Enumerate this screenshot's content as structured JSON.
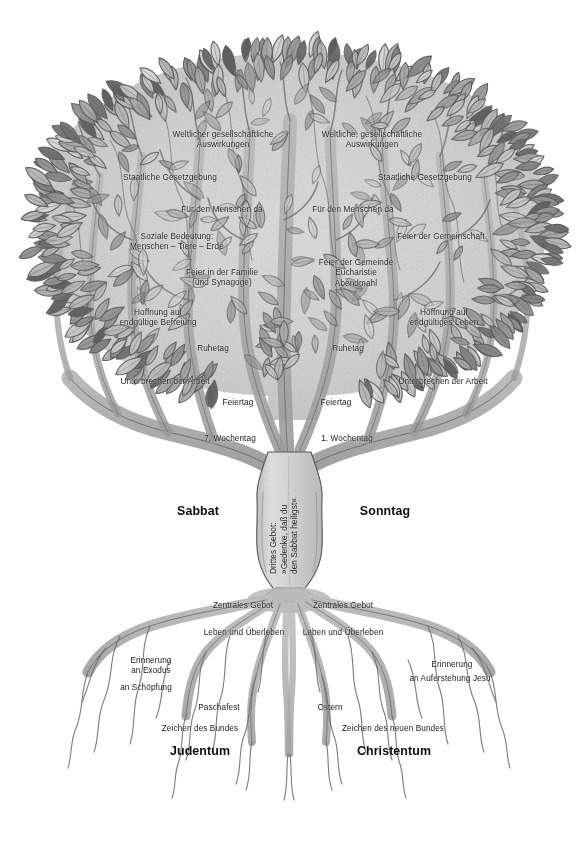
{
  "figure": {
    "type": "tree-diagram",
    "title_visible": false,
    "background_color": "#ffffff",
    "ink_color": "#4a4a4a",
    "palette": {
      "leaf_light": "#c8c8c8",
      "leaf_mid": "#9a9a9a",
      "leaf_dark": "#6b6b6b",
      "canopy_wash": "#d4d4d4",
      "branch": "#a8a8a8",
      "branch_dark": "#7d7d7d",
      "trunk": "#cfcfcf",
      "root": "#b4b4b4",
      "text": "#1a1a1a"
    }
  },
  "trunk": {
    "lines": [
      "Drittes Gebot:",
      "»Gedenke, daß du",
      "den Sabbat heiligst«"
    ]
  },
  "sides": {
    "left": {
      "name": "Sabbat",
      "base": "Judentum"
    },
    "right": {
      "name": "Sonntag",
      "base": "Christentum"
    }
  },
  "canopy_labels": {
    "left": [
      {
        "id": "l-weltliche",
        "text": "Weltlicher gesellschaftliche\nAuswirkungen",
        "x": 223,
        "y": 130,
        "align": "c"
      },
      {
        "id": "l-staatliche",
        "text": "Staatliche Gesetzgebung",
        "x": 170,
        "y": 173,
        "align": "c"
      },
      {
        "id": "l-fuerdenmenschen",
        "text": "Für den Menschen da",
        "x": 222,
        "y": 205,
        "align": "c"
      },
      {
        "id": "l-soziale",
        "text": "Soziale Bedeutung:\nMenschen – Tiere – Erde",
        "x": 177,
        "y": 232,
        "align": "c"
      },
      {
        "id": "l-feierfamilie",
        "text": "Feier in der Familie\n(und Synagoge)",
        "x": 222,
        "y": 268,
        "align": "c"
      },
      {
        "id": "l-hoffnung",
        "text": "Hoffnung auf\nendgültige Befreiung",
        "x": 158,
        "y": 308,
        "align": "c"
      },
      {
        "id": "l-ruhetag",
        "text": "Ruhetag",
        "x": 213,
        "y": 344,
        "align": "c"
      },
      {
        "id": "l-unterbrechen",
        "text": "Unterbrechen der Arbeit",
        "x": 165,
        "y": 377,
        "align": "c"
      },
      {
        "id": "l-feiertag",
        "text": "Feiertag",
        "x": 238,
        "y": 398,
        "align": "c"
      },
      {
        "id": "l-wochentag",
        "text": "7. Wochentag",
        "x": 230,
        "y": 434,
        "align": "c"
      }
    ],
    "right": [
      {
        "id": "r-weltliche",
        "text": "Weltliche, gesellschaftliche\nAuswirkungen",
        "x": 372,
        "y": 130,
        "align": "c"
      },
      {
        "id": "r-staatliche",
        "text": "Staatliche Gesetzgebung",
        "x": 425,
        "y": 173,
        "align": "c"
      },
      {
        "id": "r-fuerdenmenschen",
        "text": "Für den Menschen da",
        "x": 353,
        "y": 205,
        "align": "c"
      },
      {
        "id": "r-feiergemeinschaft",
        "text": "Feier der Gemeinschaft",
        "x": 441,
        "y": 232,
        "align": "c"
      },
      {
        "id": "r-feiergemeinde",
        "text": "Feier der Gemeinde\nEucharistie\nAbendmahl",
        "x": 356,
        "y": 258,
        "align": "c"
      },
      {
        "id": "r-hoffnung",
        "text": "Hoffnung auf\nendgültiges Leben",
        "x": 444,
        "y": 308,
        "align": "c"
      },
      {
        "id": "r-ruhetag",
        "text": "Ruhetag",
        "x": 348,
        "y": 344,
        "align": "c"
      },
      {
        "id": "r-unterbrechen",
        "text": "Unterbrechen der Arbeit",
        "x": 443,
        "y": 377,
        "align": "c"
      },
      {
        "id": "r-feiertag",
        "text": "Feiertag",
        "x": 336,
        "y": 398,
        "align": "c"
      },
      {
        "id": "r-wochentag",
        "text": "1. Wochentag",
        "x": 347,
        "y": 434,
        "align": "c"
      }
    ]
  },
  "side_names": [
    {
      "id": "name-sabbat",
      "text": "Sabbat",
      "x": 198,
      "y": 504
    },
    {
      "id": "name-sonntag",
      "text": "Sonntag",
      "x": 385,
      "y": 504
    }
  ],
  "root_labels": {
    "left": [
      {
        "id": "l-zentrales",
        "text": "Zentrales Gebot",
        "x": 243,
        "y": 601,
        "align": "c"
      },
      {
        "id": "l-leben",
        "text": "Leben und Überleben",
        "x": 244,
        "y": 628,
        "align": "c"
      },
      {
        "id": "l-erinnerung",
        "text": "Erinnerung\nan Exodus",
        "x": 151,
        "y": 656,
        "align": "c"
      },
      {
        "id": "l-schoepfung",
        "text": "an Schöpfung",
        "x": 146,
        "y": 683,
        "align": "c"
      },
      {
        "id": "l-paschafest",
        "text": "Paschafest",
        "x": 219,
        "y": 703,
        "align": "c"
      },
      {
        "id": "l-zeichen",
        "text": "Zeichen des Bundes",
        "x": 200,
        "y": 724,
        "align": "c"
      }
    ],
    "right": [
      {
        "id": "r-zentrales",
        "text": "Zentrales Gebot",
        "x": 343,
        "y": 601,
        "align": "c"
      },
      {
        "id": "r-leben",
        "text": "Leben und Überleben",
        "x": 343,
        "y": 628,
        "align": "c"
      },
      {
        "id": "r-erinnerung",
        "text": "Erinnerung",
        "x": 452,
        "y": 660,
        "align": "c"
      },
      {
        "id": "r-auferstehung",
        "text": "an Auferstehung Jesu",
        "x": 450,
        "y": 674,
        "align": "c"
      },
      {
        "id": "r-ostern",
        "text": "Ostern",
        "x": 330,
        "y": 703,
        "align": "c"
      },
      {
        "id": "r-zeichen",
        "text": "Zeichen des neuen Bundes",
        "x": 393,
        "y": 724,
        "align": "c"
      }
    ]
  },
  "base_names": [
    {
      "id": "base-judentum",
      "text": "Judentum",
      "x": 200,
      "y": 744
    },
    {
      "id": "base-christentum",
      "text": "Christentum",
      "x": 394,
      "y": 744
    }
  ]
}
